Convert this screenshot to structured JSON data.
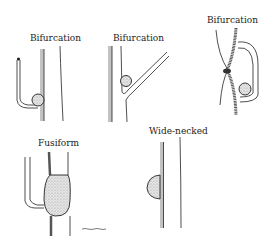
{
  "figure": {
    "panels": [
      {
        "id": "bifurcation-1",
        "label": "Bifurcation"
      },
      {
        "id": "bifurcation-2",
        "label": "Bifurcation"
      },
      {
        "id": "bifurcation-3",
        "label": "Bifurcation"
      },
      {
        "id": "fusiform",
        "label": "Fusiform"
      },
      {
        "id": "wide-necked",
        "label": "Wide-necked"
      }
    ],
    "signature": "artist signature",
    "colors": {
      "ink": "#222222",
      "shade": "#8a8a8a",
      "fill": "#d9d9d9",
      "background": "#ffffff"
    }
  }
}
